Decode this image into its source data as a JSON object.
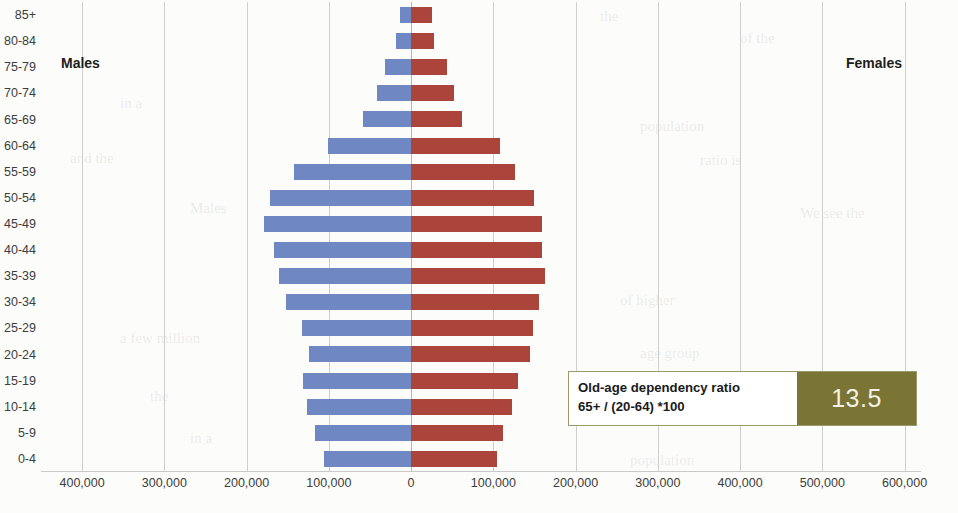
{
  "chart_data": {
    "type": "bar",
    "chart_style": "population-pyramid",
    "title": "",
    "xlabel": "",
    "ylabel": "",
    "grid": true,
    "legend_position": "inline-top-corners",
    "categories": [
      "0-4",
      "5-9",
      "10-14",
      "15-19",
      "20-24",
      "25-29",
      "30-34",
      "35-39",
      "40-44",
      "45-49",
      "50-54",
      "55-59",
      "60-64",
      "65-69",
      "70-74",
      "75-79",
      "80-84",
      "85+"
    ],
    "axis_ticks": [
      {
        "label": "400,000",
        "value": -400000
      },
      {
        "label": "300,000",
        "value": -300000
      },
      {
        "label": "200,000",
        "value": -200000
      },
      {
        "label": "100,000",
        "value": -100000
      },
      {
        "label": "0",
        "value": 0
      },
      {
        "label": "100,000",
        "value": 100000
      },
      {
        "label": "200,000",
        "value": 200000
      },
      {
        "label": "300,000",
        "value": 300000
      },
      {
        "label": "400,000",
        "value": 400000
      },
      {
        "label": "500,000",
        "value": 500000
      },
      {
        "label": "600,000",
        "value": 600000
      }
    ],
    "xlim": [
      -450000,
      620000
    ],
    "series": [
      {
        "name": "Males",
        "color": "#6f88c3",
        "side": "left",
        "values": [
          106000,
          117000,
          126000,
          131000,
          124000,
          133000,
          152000,
          161000,
          167000,
          179000,
          172000,
          142000,
          101000,
          58000,
          42000,
          32000,
          18000,
          14000
        ]
      },
      {
        "name": "Females",
        "color": "#ab453b",
        "side": "right",
        "values": [
          105000,
          112000,
          123000,
          130000,
          145000,
          148000,
          155000,
          163000,
          159000,
          159000,
          150000,
          126000,
          108000,
          62000,
          52000,
          44000,
          28000,
          25000
        ]
      }
    ]
  },
  "plot": {
    "males_caption": "Males",
    "females_caption": "Females"
  },
  "callout": {
    "line1": "Old-age dependency ratio",
    "line2": "65+ / (20-64) *100",
    "value": "13.5",
    "box_color": "#7a7535"
  },
  "background_scan_text": {
    "items": [
      "the",
      "of the",
      "in a",
      "population",
      "and the",
      "ratio is",
      "Males",
      "We see the",
      "of higher",
      "a few million",
      "age group"
    ]
  }
}
